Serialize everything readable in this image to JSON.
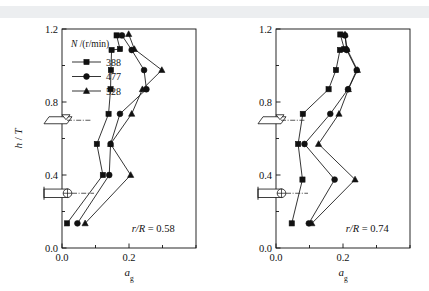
{
  "figure": {
    "background_color": "#ffffff",
    "band_color": "#eceef0",
    "line_color": "#111111"
  },
  "chart_data": [
    {
      "type": "line",
      "panel": "left",
      "title": "",
      "xlabel": "a_g",
      "xlabel_base": "a",
      "xlabel_sub": "g",
      "ylabel": "h / T",
      "ylabel_num": "h",
      "ylabel_den": "T",
      "ylabel_sep": "/",
      "xlim": [
        0.0,
        0.4
      ],
      "ylim": [
        0.0,
        1.2
      ],
      "xticks": [
        0.0,
        0.1,
        0.2,
        0.3,
        0.4
      ],
      "xtick_labels": [
        "0.0",
        "",
        "0.2",
        "",
        ""
      ],
      "yticks": [
        0.0,
        0.2,
        0.4,
        0.6,
        0.8,
        1.0,
        1.2
      ],
      "ytick_labels": [
        "0.0",
        "",
        "0.4",
        "",
        "0.8",
        "",
        "1.2"
      ],
      "grid": false,
      "annotation": "r/R = 0.58",
      "annotation_italic_part": "r/R",
      "annotation_value": " = 0.58",
      "legend_position": "upper-left",
      "legend_title": "N /(r/min)",
      "legend_title_italic": "N",
      "legend_title_rest": " /(r/min)",
      "series": [
        {
          "name": "388",
          "marker": "square",
          "values_x": [
            0.015,
            0.122,
            0.104,
            0.139,
            0.145,
            0.146,
            0.148,
            0.173,
            0.163
          ],
          "values_y": [
            0.135,
            0.4,
            0.57,
            0.735,
            0.87,
            0.975,
            1.085,
            1.09,
            1.165
          ]
        },
        {
          "name": "477",
          "marker": "circle",
          "values_x": [
            0.046,
            0.141,
            0.145,
            0.173,
            0.252,
            0.245,
            0.208,
            0.179
          ],
          "values_y": [
            0.135,
            0.4,
            0.57,
            0.735,
            0.87,
            0.975,
            1.085,
            1.165
          ]
        },
        {
          "name": "528",
          "marker": "triangle",
          "values_x": [
            0.069,
            0.205,
            0.145,
            0.208,
            0.24,
            0.298,
            0.216,
            0.199
          ],
          "values_y": [
            0.135,
            0.4,
            0.57,
            0.735,
            0.87,
            0.975,
            1.09,
            1.172
          ]
        }
      ],
      "markers": [
        {
          "name": "liquid-surface-marker",
          "y": 0.7
        },
        {
          "name": "impeller-marker",
          "y": 0.3
        }
      ]
    },
    {
      "type": "line",
      "panel": "right",
      "title": "",
      "xlabel": "a_g",
      "xlabel_base": "a",
      "xlabel_sub": "g",
      "ylabel": "",
      "xlim": [
        0.0,
        0.4
      ],
      "ylim": [
        0.0,
        1.2
      ],
      "xticks": [
        0.0,
        0.1,
        0.2,
        0.3,
        0.4
      ],
      "xtick_labels": [
        "0.0",
        "",
        "0.2",
        "",
        ""
      ],
      "yticks": [
        0.0,
        0.2,
        0.4,
        0.6,
        0.8,
        1.0,
        1.2
      ],
      "ytick_labels": [
        "0.0",
        "",
        "0.4",
        "",
        "0.8",
        "",
        "1.2"
      ],
      "grid": false,
      "annotation": "r/R = 0.74",
      "annotation_italic_part": "r/R",
      "annotation_value": " = 0.74",
      "series": [
        {
          "name": "388",
          "marker": "square",
          "values_x": [
            0.047,
            0.079,
            0.066,
            0.08,
            0.157,
            0.179,
            0.191,
            0.204,
            0.192
          ],
          "values_y": [
            0.135,
            0.375,
            0.57,
            0.735,
            0.87,
            0.975,
            1.085,
            1.09,
            1.17
          ]
        },
        {
          "name": "477",
          "marker": "circle",
          "values_x": [
            0.098,
            0.175,
            0.085,
            0.162,
            0.215,
            0.241,
            0.211,
            0.206
          ],
          "values_y": [
            0.135,
            0.375,
            0.57,
            0.735,
            0.87,
            0.975,
            1.085,
            1.165
          ]
        },
        {
          "name": "528",
          "marker": "triangle",
          "values_x": [
            0.107,
            0.236,
            0.127,
            0.188,
            0.216,
            0.243,
            0.212,
            0.206
          ],
          "values_y": [
            0.135,
            0.375,
            0.57,
            0.735,
            0.87,
            0.975,
            1.09,
            1.17
          ]
        }
      ],
      "markers": [
        {
          "name": "liquid-surface-marker",
          "y": 0.7
        },
        {
          "name": "impeller-marker",
          "y": 0.3
        }
      ]
    }
  ]
}
